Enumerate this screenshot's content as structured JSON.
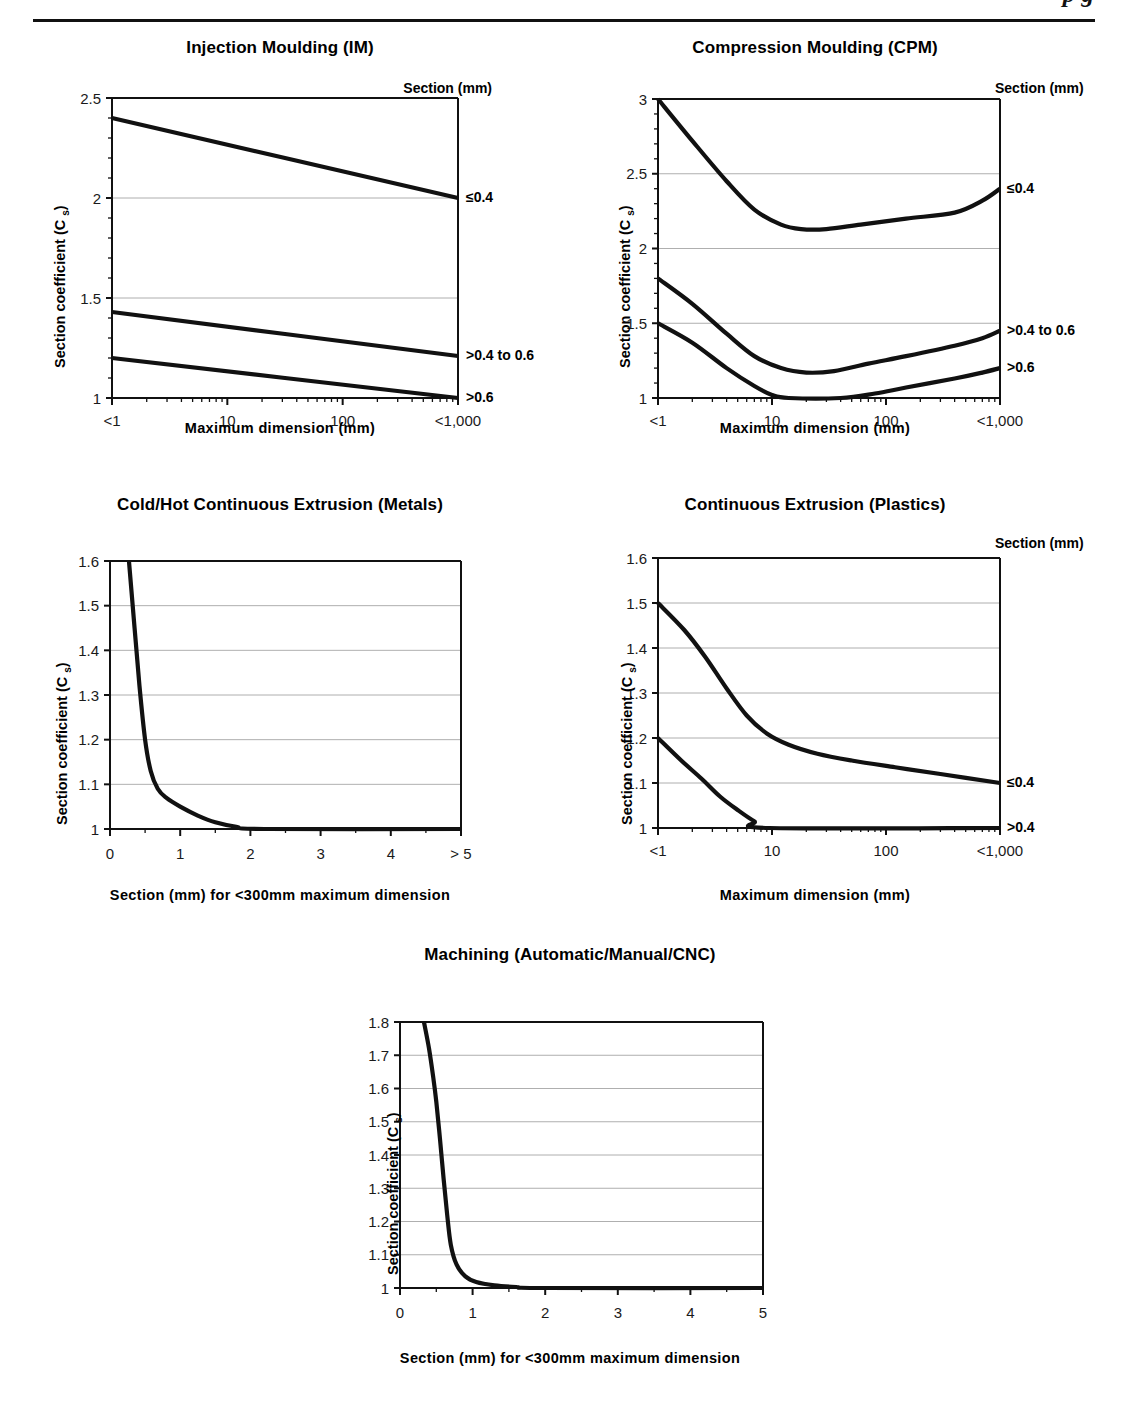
{
  "running_head": {
    "text": "p      g",
    "note": "clipped italic running head at page top"
  },
  "common": {
    "ylabel": "Section coefficient (C s)",
    "section_legend_title": "Section (mm)",
    "xlabel_log": "Maximum dimension (mm)",
    "xlabel_linear": "Section (mm) for <300mm maximum dimension"
  },
  "chart_data": [
    {
      "id": "injection-moulding",
      "type": "line",
      "title": "Injection Moulding (IM)",
      "xlabel": "Maximum dimension (mm)",
      "ylabel": "Section coefficient (C s)",
      "legend_title": "Section (mm)",
      "legend_position": "top-right",
      "grid": true,
      "xscale": "log",
      "xticklabels": [
        "<1",
        "10",
        "100",
        "<1,000"
      ],
      "x": [
        1,
        10,
        100,
        1000
      ],
      "ylim": [
        1,
        2.5
      ],
      "yticklabels": [
        "1",
        "1.5",
        "2",
        "2.5"
      ],
      "yticks": [
        1,
        1.5,
        2,
        2.5
      ],
      "series": [
        {
          "name": "≤0.4",
          "points": [
            [
              1,
              2.4
            ],
            [
              1000,
              2.0
            ]
          ]
        },
        {
          "name": ">0.4 to 0.6",
          "points": [
            [
              1,
              1.43
            ],
            [
              1000,
              1.21
            ]
          ]
        },
        {
          "name": ">0.6",
          "points": [
            [
              1,
              1.2
            ],
            [
              1000,
              1.0
            ]
          ]
        }
      ]
    },
    {
      "id": "compression-moulding",
      "type": "line",
      "title": "Compression Moulding (CPM)",
      "xlabel": "Maximum dimension (mm)",
      "ylabel": "Section coefficient (C s)",
      "legend_title": "Section (mm)",
      "legend_position": "top-right",
      "grid": true,
      "xscale": "log",
      "xticklabels": [
        "<1",
        "10",
        "100",
        "<1,000"
      ],
      "x": [
        1,
        10,
        100,
        1000
      ],
      "ylim": [
        1,
        3
      ],
      "yticklabels": [
        "1",
        "1.5",
        "2",
        "2.5",
        "3"
      ],
      "yticks": [
        1,
        1.5,
        2,
        2.5,
        3
      ],
      "series": [
        {
          "name": "≤0.4",
          "points": [
            [
              1,
              3.0
            ],
            [
              2,
              2.72
            ],
            [
              4,
              2.45
            ],
            [
              7,
              2.26
            ],
            [
              12,
              2.16
            ],
            [
              18,
              2.13
            ],
            [
              30,
              2.13
            ],
            [
              60,
              2.16
            ],
            [
              150,
              2.2
            ],
            [
              400,
              2.24
            ],
            [
              700,
              2.32
            ],
            [
              1000,
              2.4
            ]
          ]
        },
        {
          "name": ">0.4 to 0.6",
          "points": [
            [
              1,
              1.8
            ],
            [
              2,
              1.63
            ],
            [
              4,
              1.43
            ],
            [
              7,
              1.28
            ],
            [
              12,
              1.2
            ],
            [
              20,
              1.17
            ],
            [
              35,
              1.18
            ],
            [
              70,
              1.23
            ],
            [
              150,
              1.28
            ],
            [
              400,
              1.35
            ],
            [
              700,
              1.4
            ],
            [
              1000,
              1.45
            ]
          ]
        },
        {
          "name": ">0.6",
          "points": [
            [
              1,
              1.5
            ],
            [
              2,
              1.37
            ],
            [
              4,
              1.2
            ],
            [
              7,
              1.08
            ],
            [
              10,
              1.02
            ],
            [
              14,
              1.0
            ],
            [
              40,
              1.0
            ],
            [
              80,
              1.03
            ],
            [
              150,
              1.07
            ],
            [
              400,
              1.13
            ],
            [
              700,
              1.17
            ],
            [
              1000,
              1.2
            ]
          ]
        }
      ]
    },
    {
      "id": "cold-hot-continuous-extrusion-metals",
      "type": "line",
      "title": "Cold/Hot Continuous Extrusion (Metals)",
      "xlabel": "Section (mm) for <300mm maximum dimension",
      "ylabel": "Section coefficient (C s)",
      "grid": true,
      "xscale": "linear",
      "xticklabels": [
        "0",
        "1",
        "2",
        "3",
        "4",
        "> 5"
      ],
      "xticks": [
        0,
        1,
        2,
        3,
        4,
        5
      ],
      "xlim": [
        0,
        5
      ],
      "ylim": [
        1,
        1.6
      ],
      "yticklabels": [
        "1",
        "1.1",
        "1.2",
        "1.3",
        "1.4",
        "1.5",
        "1.6"
      ],
      "yticks": [
        1,
        1.1,
        1.2,
        1.3,
        1.4,
        1.5,
        1.6
      ],
      "series": [
        {
          "name": "Cs",
          "points": [
            [
              0.27,
              1.6
            ],
            [
              0.35,
              1.45
            ],
            [
              0.42,
              1.32
            ],
            [
              0.5,
              1.2
            ],
            [
              0.58,
              1.13
            ],
            [
              0.68,
              1.09
            ],
            [
              0.8,
              1.07
            ],
            [
              1.0,
              1.05
            ],
            [
              1.25,
              1.03
            ],
            [
              1.5,
              1.015
            ],
            [
              1.8,
              1.005
            ],
            [
              2.2,
              1.0
            ],
            [
              5,
              1.0
            ]
          ]
        }
      ]
    },
    {
      "id": "continuous-extrusion-plastics",
      "type": "line",
      "title": "Continuous Extrusion (Plastics)",
      "xlabel": "Maximum dimension (mm)",
      "ylabel": "Section coefficient (C s)",
      "legend_title": "Section (mm)",
      "legend_position": "top-right",
      "grid": true,
      "xscale": "log",
      "xticklabels": [
        "<1",
        "10",
        "100",
        "<1,000"
      ],
      "x": [
        1,
        10,
        100,
        1000
      ],
      "ylim": [
        1,
        1.6
      ],
      "yticklabels": [
        "1",
        "1.1",
        "1.2",
        "1.3",
        "1.4",
        "1.5",
        "1.6"
      ],
      "yticks": [
        1,
        1.1,
        1.2,
        1.3,
        1.4,
        1.5,
        1.6
      ],
      "series": [
        {
          "name": "≤0.4",
          "points": [
            [
              1,
              1.5
            ],
            [
              1.7,
              1.44
            ],
            [
              2.6,
              1.38
            ],
            [
              4,
              1.31
            ],
            [
              6,
              1.25
            ],
            [
              9,
              1.21
            ],
            [
              14,
              1.185
            ],
            [
              25,
              1.165
            ],
            [
              50,
              1.15
            ],
            [
              120,
              1.135
            ],
            [
              300,
              1.12
            ],
            [
              1000,
              1.1
            ]
          ]
        },
        {
          "name": ">0.4",
          "points": [
            [
              1,
              1.2
            ],
            [
              1.6,
              1.15
            ],
            [
              2.4,
              1.11
            ],
            [
              3.5,
              1.07
            ],
            [
              5,
              1.04
            ],
            [
              7,
              1.015
            ],
            [
              9.5,
              1.0
            ],
            [
              1000,
              1.0
            ]
          ]
        }
      ]
    },
    {
      "id": "machining",
      "type": "line",
      "title": "Machining (Automatic/Manual/CNC)",
      "xlabel": "Section (mm) for <300mm maximum dimension",
      "ylabel": "Section coefficient (C s)",
      "grid": true,
      "xscale": "linear",
      "xticklabels": [
        "0",
        "1",
        "2",
        "3",
        "4",
        "5"
      ],
      "xticks": [
        0,
        1,
        2,
        3,
        4,
        5
      ],
      "xlim": [
        0,
        5
      ],
      "ylim": [
        1,
        1.8
      ],
      "yticklabels": [
        "1",
        "1.1",
        "1.2",
        "1.3",
        "1.4",
        "1.5",
        "1.6",
        "1.7",
        "1.8"
      ],
      "yticks": [
        1,
        1.1,
        1.2,
        1.3,
        1.4,
        1.5,
        1.6,
        1.7,
        1.8
      ],
      "series": [
        {
          "name": "Cs",
          "points": [
            [
              0.33,
              1.8
            ],
            [
              0.4,
              1.72
            ],
            [
              0.46,
              1.63
            ],
            [
              0.5,
              1.56
            ],
            [
              0.55,
              1.45
            ],
            [
              0.6,
              1.33
            ],
            [
              0.65,
              1.22
            ],
            [
              0.7,
              1.13
            ],
            [
              0.78,
              1.07
            ],
            [
              0.9,
              1.035
            ],
            [
              1.05,
              1.018
            ],
            [
              1.3,
              1.008
            ],
            [
              1.6,
              1.003
            ],
            [
              2.0,
              1.0
            ],
            [
              5,
              1.0
            ]
          ]
        }
      ]
    }
  ]
}
